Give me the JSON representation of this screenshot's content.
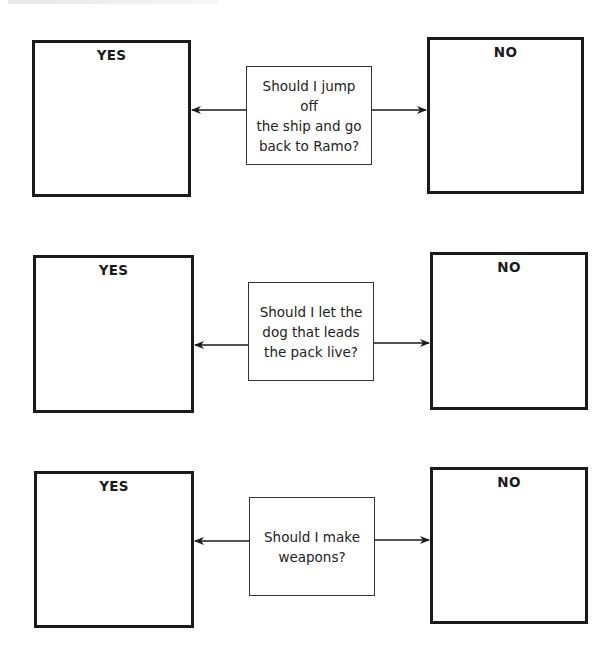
{
  "diagram": {
    "rows": [
      {
        "question": "Should I jump off\nthe ship and go\nback to Ramo?",
        "yes_label": "YES",
        "no_label": "NO"
      },
      {
        "question": "Should I let the\ndog that leads\nthe pack live?",
        "yes_label": "YES",
        "no_label": "NO"
      },
      {
        "question": "Should I make\nweapons?",
        "yes_label": "YES",
        "no_label": "NO"
      }
    ]
  },
  "colors": {
    "line": "#1a1a1a",
    "background": "#ffffff"
  }
}
